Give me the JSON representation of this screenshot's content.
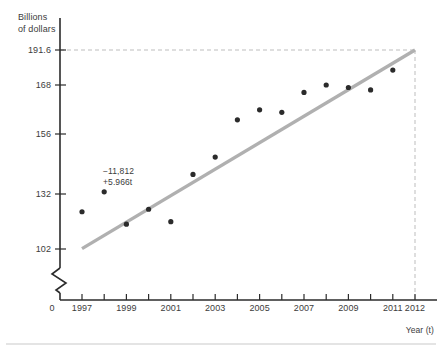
{
  "chart_data": {
    "type": "scatter",
    "title": "",
    "subtitle": "",
    "xlabel": "Year (t)",
    "ylabel": "Billions of dollars",
    "ylabel_line1": "Billions",
    "ylabel_line2": "of dollars",
    "origin_label": "0",
    "grid": false,
    "legend": null,
    "xlim": [
      1996.2,
      2012.6
    ],
    "ylim": [
      96,
      196
    ],
    "axis_break": true,
    "axis_break_note": "zigzag break on vertical axis below 102",
    "yticks": [
      102,
      132,
      156,
      168,
      191.6
    ],
    "ytick_labels": [
      "102",
      "132",
      "156",
      "168",
      "191.6"
    ],
    "xticks": [
      1997,
      1998,
      1999,
      2000,
      2001,
      2002,
      2003,
      2004,
      2005,
      2006,
      2007,
      2008,
      2009,
      2010,
      2011,
      2012
    ],
    "xtick_labels": [
      "1997",
      "1999",
      "2001",
      "2003",
      "2005",
      "2007",
      "2009",
      "2011",
      "2012"
    ],
    "xtick_labeled_values": [
      1997,
      1999,
      2001,
      2003,
      2005,
      2007,
      2009,
      2011,
      2012
    ],
    "x": [
      1997,
      1998,
      1999,
      2000,
      2001,
      2002,
      2003,
      2004,
      2005,
      2006,
      2007,
      2008,
      2009,
      2010,
      2011
    ],
    "y": [
      117.0,
      125.0,
      112.0,
      118.0,
      113.0,
      132.0,
      139.0,
      154.0,
      158.0,
      157.0,
      165.0,
      168.0,
      167.0,
      166.0,
      174.0
    ],
    "point_color": "#2b2b2b",
    "point_radius": 2.6,
    "series": [
      {
        "name": "observed",
        "type": "scatter",
        "values": [
          117.0,
          125.0,
          112.0,
          118.0,
          113.0,
          132.0,
          139.0,
          154.0,
          158.0,
          157.0,
          165.0,
          168.0,
          167.0,
          166.0,
          174.0
        ]
      },
      {
        "name": "least-squares trend line",
        "type": "line",
        "equation": "-11,812 + 5.966t",
        "intercept": -11812,
        "slope": 5.966,
        "color": "#b0b0b0",
        "endpoints": [
          {
            "x": 1997,
            "y": 103.0
          },
          {
            "x": 2012,
            "y": 191.6
          }
        ]
      }
    ],
    "annotations": [
      {
        "name": "regression-equation",
        "line1": "−11,812",
        "line2": "+5.966t",
        "x": 2000.1,
        "y": 143
      }
    ],
    "reference_lines": [
      {
        "name": "prediction-horizontal",
        "orientation": "horizontal",
        "value": 191.6,
        "style": "dashed",
        "color": "#bdbdbd"
      },
      {
        "name": "prediction-vertical",
        "orientation": "vertical",
        "value": 2012,
        "style": "dashed",
        "color": "#bdbdbd"
      }
    ]
  },
  "colors": {
    "axis": "#2b2b2b",
    "trend_line": "#b0b0b0",
    "dashed_guide": "#bdbdbd",
    "point": "#2b2b2b",
    "text": "#3c3c3c",
    "divider": "#c9c9c9",
    "background": "#ffffff"
  },
  "footer": {
    "divider_visible": true
  }
}
